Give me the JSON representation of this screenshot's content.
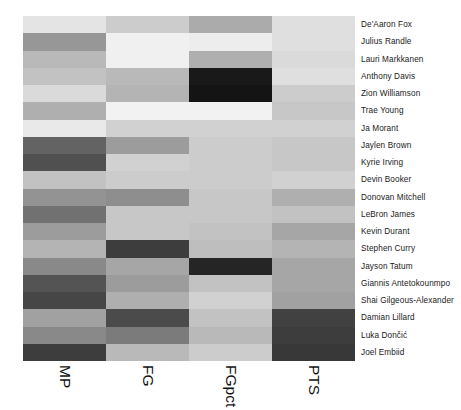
{
  "chart_data": {
    "type": "heatmap",
    "title": "",
    "subtitle": "",
    "xlabel": "",
    "ylabel": "",
    "grid": false,
    "legend": "none",
    "colormap": "greys",
    "colormap_note": "light = low normalized value, dark = high normalized value",
    "columns": [
      "MP",
      "FG",
      "FGpct",
      "PTS"
    ],
    "rows": [
      "De'Aaron Fox",
      "Julius Randle",
      "Lauri Markkanen",
      "Anthony Davis",
      "Zion Williamson",
      "Trae Young",
      "Ja Morant",
      "Jaylen Brown",
      "Kyrie Irving",
      "Devin Booker",
      "Donovan Mitchell",
      "LeBron James",
      "Kevin Durant",
      "Stephen Curry",
      "Jayson Tatum",
      "Giannis Antetokounmpo",
      "Shai Gilgeous-Alexander",
      "Damian Lillard",
      "Luka Dončić",
      "Joel Embiid"
    ],
    "values": [
      [
        0.08,
        0.18,
        0.32,
        0.1
      ],
      [
        0.4,
        0.03,
        0.04,
        0.1
      ],
      [
        0.26,
        0.03,
        0.3,
        0.12
      ],
      [
        0.22,
        0.26,
        0.93,
        0.1
      ],
      [
        0.12,
        0.28,
        0.95,
        0.18
      ],
      [
        0.3,
        0.02,
        0.02,
        0.2
      ],
      [
        0.06,
        0.16,
        0.16,
        0.16
      ],
      [
        0.62,
        0.38,
        0.18,
        0.2
      ],
      [
        0.7,
        0.16,
        0.18,
        0.2
      ],
      [
        0.22,
        0.18,
        0.18,
        0.16
      ],
      [
        0.42,
        0.44,
        0.2,
        0.3
      ],
      [
        0.56,
        0.2,
        0.2,
        0.22
      ],
      [
        0.38,
        0.2,
        0.22,
        0.34
      ],
      [
        0.28,
        0.78,
        0.24,
        0.28
      ],
      [
        0.46,
        0.34,
        0.88,
        0.34
      ],
      [
        0.68,
        0.38,
        0.22,
        0.34
      ],
      [
        0.74,
        0.3,
        0.16,
        0.36
      ],
      [
        0.36,
        0.72,
        0.22,
        0.76
      ],
      [
        0.46,
        0.52,
        0.26,
        0.78
      ],
      [
        0.78,
        0.26,
        0.18,
        0.8
      ],
      [
        0.56,
        0.38,
        0.26,
        0.84
      ],
      [
        0.22,
        0.74,
        0.62,
        0.82
      ]
    ],
    "zlim": [
      0.0,
      1.0
    ]
  }
}
